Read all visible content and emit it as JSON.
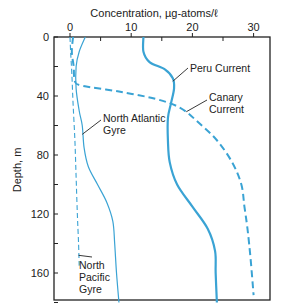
{
  "chart_data": {
    "type": "line",
    "title": "",
    "xlabel": "Concentration, µg-atoms/ℓ",
    "ylabel": "Depth, m",
    "xlim": [
      0,
      32
    ],
    "ylim": [
      180,
      0
    ],
    "x_ticks": [
      0,
      10,
      20,
      30
    ],
    "y_ticks": [
      0,
      40,
      80,
      120,
      160
    ],
    "x_axis_position": "top",
    "grid": false,
    "legend": "inline labels",
    "series": [
      {
        "name": "Peru Current",
        "style": "solid-thick",
        "points": [
          [
            12,
            0
          ],
          [
            12,
            10
          ],
          [
            13,
            17
          ],
          [
            15.5,
            22
          ],
          [
            16.8,
            28
          ],
          [
            17,
            35
          ],
          [
            16.5,
            45
          ],
          [
            16,
            55
          ],
          [
            16,
            70
          ],
          [
            16.3,
            85
          ],
          [
            17.5,
            100
          ],
          [
            20,
            115
          ],
          [
            22.5,
            130
          ],
          [
            23.7,
            145
          ],
          [
            23.8,
            160
          ],
          [
            24,
            180
          ]
        ]
      },
      {
        "name": "Canary Current",
        "style": "dashed-thick",
        "points": [
          [
            0.5,
            0
          ],
          [
            0.3,
            10
          ],
          [
            0.6,
            20
          ],
          [
            0.8,
            30
          ],
          [
            2,
            33
          ],
          [
            8,
            37
          ],
          [
            14,
            42
          ],
          [
            18,
            48
          ],
          [
            21,
            58
          ],
          [
            24,
            70
          ],
          [
            26.5,
            85
          ],
          [
            28,
            100
          ],
          [
            28.5,
            115
          ],
          [
            29,
            130
          ],
          [
            29.5,
            150
          ],
          [
            30,
            175
          ]
        ]
      },
      {
        "name": "North Atlantic Gyre",
        "style": "solid-thin",
        "points": [
          [
            2.5,
            0
          ],
          [
            1.5,
            10
          ],
          [
            1,
            20
          ],
          [
            1,
            35
          ],
          [
            1.5,
            50
          ],
          [
            2,
            60
          ],
          [
            2.3,
            75
          ],
          [
            3,
            88
          ],
          [
            4.5,
            100
          ],
          [
            6,
            112
          ],
          [
            7,
            125
          ],
          [
            7.3,
            140
          ],
          [
            7.6,
            160
          ],
          [
            8,
            180
          ]
        ]
      },
      {
        "name": "North Pacific Gyre",
        "style": "dashed-thin",
        "points": [
          [
            0,
            0
          ],
          [
            0.1,
            10
          ],
          [
            0.3,
            25
          ],
          [
            0.5,
            45
          ],
          [
            0.8,
            70
          ],
          [
            1,
            95
          ],
          [
            1.2,
            120
          ],
          [
            1.4,
            140
          ],
          [
            1.5,
            155
          ]
        ]
      }
    ],
    "annotations": [
      {
        "text": "Peru Current",
        "points_to": [
          16.8,
          30
        ]
      },
      {
        "text": "Canary Current",
        "points_to": [
          19,
          50
        ]
      },
      {
        "text": "North Atlantic Gyre",
        "points_to": [
          2,
          66
        ]
      },
      {
        "text": "North Pacific Gyre",
        "points_to": [
          1.4,
          148
        ]
      }
    ],
    "colors": {
      "line": "#3aa3d4",
      "axis": "#222222",
      "text": "#222222"
    }
  }
}
